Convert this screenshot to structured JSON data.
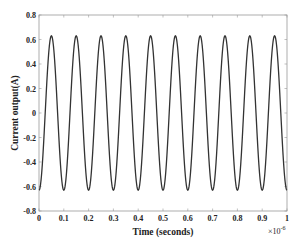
{
  "chart_data": {
    "type": "line",
    "title": "",
    "xlabel": "Time (seconds)",
    "ylabel": "Current output(A)",
    "x_exponent_label": "×10",
    "x_exponent_power": "-6",
    "xlim": [
      0,
      1
    ],
    "ylim": [
      -0.8,
      0.8
    ],
    "xticks": [
      "0",
      "0.1",
      "0.2",
      "0.3",
      "0.4",
      "0.5",
      "0.6",
      "0.7",
      "0.8",
      "0.9",
      "1"
    ],
    "yticks": [
      "0.8",
      "0.6",
      "0.4",
      "0.2",
      "0",
      "-0.2",
      "-0.4",
      "-0.6",
      "-0.8"
    ],
    "grid": false,
    "legend": null,
    "series": [
      {
        "name": "Current output",
        "function": "-0.63*cos(2*pi*10*x)",
        "amplitude": 0.63,
        "cycles": 10,
        "frequency_note": "10 cycles over 1e-6 s",
        "color": "#333333"
      }
    ]
  }
}
